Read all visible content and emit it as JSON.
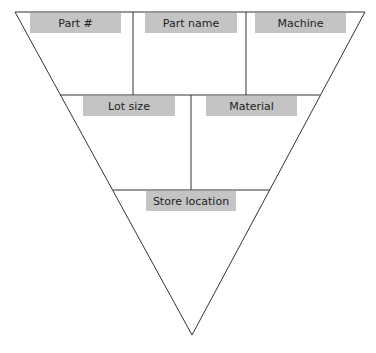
{
  "diagram": {
    "type": "kanban-triangle",
    "colors": {
      "line": "#333333",
      "label_bg": "#c4c4c4",
      "text": "#222222"
    },
    "fields": {
      "part_number": "Part #",
      "part_name": "Part name",
      "machine": "Machine",
      "lot_size": "Lot size",
      "material": "Material",
      "store_location": "Store location"
    }
  }
}
